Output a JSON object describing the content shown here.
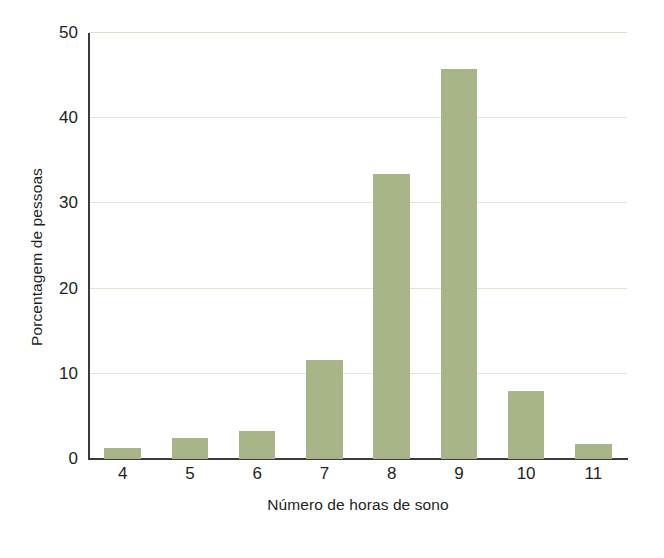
{
  "chart_data": {
    "type": "bar",
    "title": "",
    "xlabel": "Número de horas de sono",
    "ylabel": "Porcentagem de pessoas",
    "categories": [
      "4",
      "5",
      "6",
      "7",
      "8",
      "9",
      "10",
      "11"
    ],
    "values": [
      1.3,
      2.5,
      3.3,
      11.6,
      33.4,
      45.8,
      8.0,
      1.8
    ],
    "ylim": [
      0,
      50
    ],
    "yticks": [
      0,
      10,
      20,
      30,
      40,
      50
    ],
    "ytick_labels": [
      "0",
      "10",
      "20",
      "30",
      "40",
      "50"
    ],
    "grid": true,
    "grid_axis": "y",
    "legend": false,
    "bar_color": "#a8b588",
    "grid_color": "#dfe6d2",
    "axis_color": "#3b3b3b",
    "background": "#ffffff"
  }
}
